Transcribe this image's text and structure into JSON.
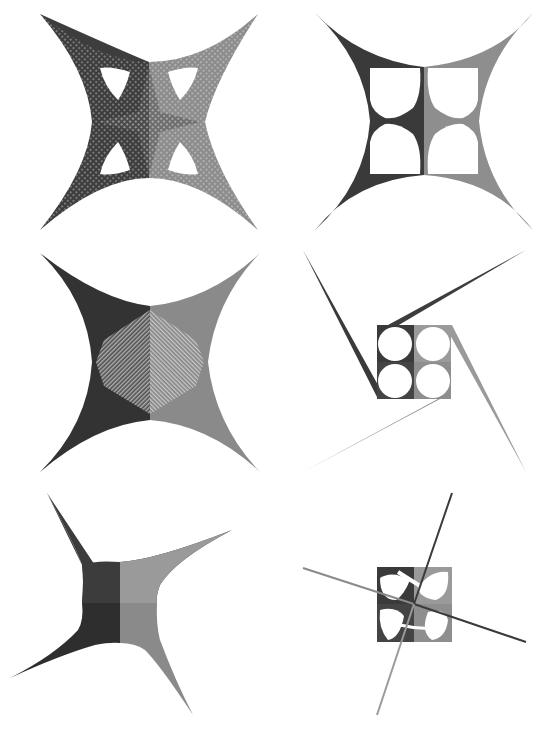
{
  "page": {
    "background": "#ffffff",
    "layout": "3 rows x 2 columns grid of geometric string-art figures"
  },
  "colors": {
    "dark": "#3a3a3a",
    "darker": "#2e2e2e",
    "mid": "#6f6f6f",
    "light": "#9a9a9a",
    "lighter": "#b0b0b0",
    "hole": "#ffffff"
  },
  "figures": [
    {
      "id": 1,
      "position": "top-left",
      "description": "Four-pointed concave star with mesh pattern and four leaf-shaped cutouts"
    },
    {
      "id": 2,
      "position": "top-right",
      "description": "Four-pointed concave star with central square containing four teardrop cutouts"
    },
    {
      "id": 3,
      "position": "middle-left",
      "description": "Four-pointed concave star with moire chevron interference pattern"
    },
    {
      "id": 4,
      "position": "middle-right",
      "description": "Pinwheel of four long spokes around a square with four circular cutouts"
    },
    {
      "id": 5,
      "position": "bottom-left",
      "description": "Rotated four-pointed concave star with solid quadrant shading"
    },
    {
      "id": 6,
      "position": "bottom-right",
      "description": "Square with four petal cutouts pierced by two crossing lines"
    }
  ]
}
